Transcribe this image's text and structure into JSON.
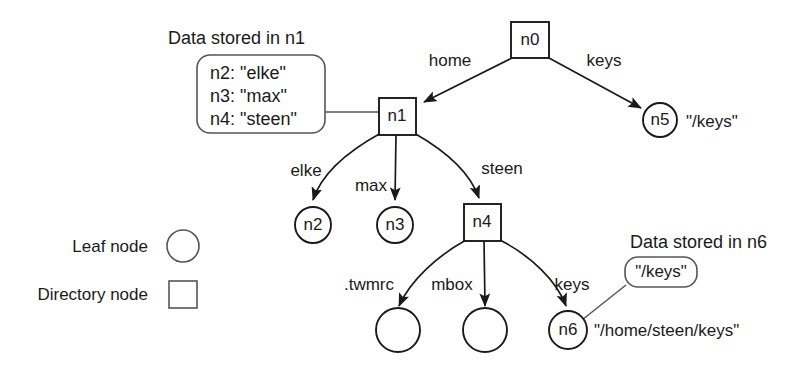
{
  "figure": {
    "annotations": {
      "n1_box_title": "Data stored in n1",
      "n1_box_lines": [
        "n2: \"elke\"",
        "n3: \"max\"",
        "n4: \"steen\""
      ],
      "n6_box_title": "Data stored in n6",
      "n6_box_value": "\"/keys\""
    },
    "nodes": [
      {
        "id": "n0",
        "label": "n0",
        "shape": "square",
        "cx": 530,
        "cy": 40
      },
      {
        "id": "n1",
        "label": "n1",
        "shape": "square",
        "cx": 397,
        "cy": 116
      },
      {
        "id": "n5",
        "label": "n5",
        "shape": "circle",
        "cx": 660,
        "cy": 120,
        "path_label": "\"/keys\""
      },
      {
        "id": "n2",
        "label": "n2",
        "shape": "circle",
        "cx": 313,
        "cy": 225
      },
      {
        "id": "n3",
        "label": "n3",
        "shape": "circle",
        "cx": 395,
        "cy": 225
      },
      {
        "id": "n4",
        "label": "n4",
        "shape": "square",
        "cx": 482,
        "cy": 222
      },
      {
        "id": "leaf_twmrc",
        "label": "",
        "shape": "circle",
        "cx": 398,
        "cy": 330
      },
      {
        "id": "leaf_mbox",
        "label": "",
        "shape": "circle",
        "cx": 485,
        "cy": 330
      },
      {
        "id": "n6",
        "label": "n6",
        "shape": "circle",
        "cx": 568,
        "cy": 330,
        "path_label": "\"/home/steen/keys\""
      }
    ],
    "edges": [
      {
        "from": "n0",
        "to": "n1",
        "label": "home"
      },
      {
        "from": "n0",
        "to": "n5",
        "label": "keys"
      },
      {
        "from": "n1",
        "to": "n2",
        "label": "elke"
      },
      {
        "from": "n1",
        "to": "n3",
        "label": "max"
      },
      {
        "from": "n1",
        "to": "n4",
        "label": "steen"
      },
      {
        "from": "n4",
        "to": "leaf_twmrc",
        "label": ".twmrc"
      },
      {
        "from": "n4",
        "to": "leaf_mbox",
        "label": "mbox"
      },
      {
        "from": "n4",
        "to": "n6",
        "label": "keys"
      }
    ],
    "legend": [
      {
        "label": "Leaf node",
        "shape": "circle"
      },
      {
        "label": "Directory node",
        "shape": "square"
      }
    ]
  }
}
